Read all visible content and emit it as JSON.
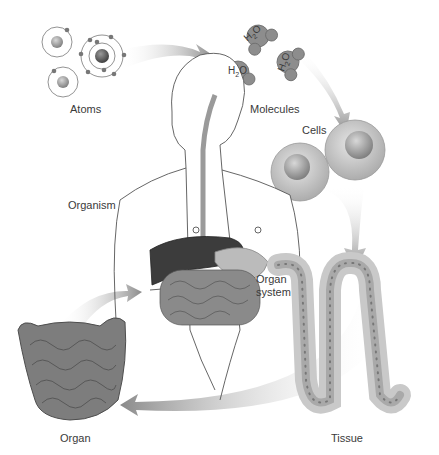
{
  "diagram": {
    "stages": [
      {
        "id": "atoms",
        "label": "Atoms"
      },
      {
        "id": "molecules",
        "label": "Molecules",
        "formula_parts": [
          "H",
          "2",
          "O"
        ]
      },
      {
        "id": "cells",
        "label": "Cells"
      },
      {
        "id": "tissue",
        "label": "Tissue"
      },
      {
        "id": "organ",
        "label": "Organ"
      },
      {
        "id": "organ_system",
        "label_line1": "Organ",
        "label_line2": "system"
      },
      {
        "id": "organism",
        "label": "Organism"
      }
    ],
    "flow": [
      "Atoms",
      "Molecules",
      "Cells",
      "Tissue",
      "Organ",
      "Organ system"
    ],
    "colors": {
      "arrow": "#8a8a8a",
      "organ": "#7d7d7d",
      "liver": "#3c3c3c",
      "cell": "#c9c9c9",
      "nucleus": "#8f8f8f",
      "outline": "#6a6a6a"
    }
  }
}
